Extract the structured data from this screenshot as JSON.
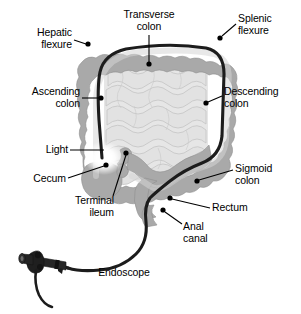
{
  "figure": {
    "type": "anatomical-diagram",
    "width": 301,
    "height": 314,
    "background": "#ffffff"
  },
  "colors": {
    "background": "#ffffff",
    "colon_wall": "#a9a9a9",
    "colon_wall_edge": "#9a9a9a",
    "colon_lumen": "#c9c9c9",
    "small_intestine": "#e4e4e4",
    "small_intestine_outline": "#bfbfbf",
    "endoscope": "#1a1a1a",
    "light_glow": "#ffffff",
    "label_text": "#000000",
    "leader_line": "#000000",
    "marker_dot": "#000000"
  },
  "labels": [
    {
      "id": "hepatic-flexure",
      "text_lines": [
        "Hepatic",
        "flexure"
      ],
      "align": "right",
      "x": 10,
      "y": 27,
      "width": 62,
      "leader": {
        "x1": 74,
        "y1": 40,
        "x2": 86,
        "y2": 44
      },
      "dot": {
        "cx": 88,
        "cy": 44,
        "r": 2.6
      }
    },
    {
      "id": "transverse-colon",
      "text_lines": [
        "Transverse",
        "colon"
      ],
      "align": "center",
      "x": 112,
      "y": 9,
      "width": 74,
      "leader": {
        "x1": 149,
        "y1": 35,
        "x2": 149,
        "y2": 62
      },
      "dot": {
        "cx": 149,
        "cy": 64,
        "r": 2.6
      }
    },
    {
      "id": "splenic-flexure",
      "text_lines": [
        "Splenic",
        "flexure"
      ],
      "align": "left",
      "x": 238,
      "y": 13,
      "width": 58,
      "leader": {
        "x1": 236,
        "y1": 24,
        "x2": 222,
        "y2": 36
      },
      "dot": {
        "cx": 220,
        "cy": 38,
        "r": 2.6
      }
    },
    {
      "id": "ascending-colon",
      "text_lines": [
        "Ascending",
        "colon"
      ],
      "align": "right",
      "x": 8,
      "y": 86,
      "width": 72,
      "leader": {
        "x1": 82,
        "y1": 98,
        "x2": 99,
        "y2": 98
      },
      "dot": {
        "cx": 101,
        "cy": 98,
        "r": 2.6
      }
    },
    {
      "id": "descending-colon",
      "text_lines": [
        "Descending",
        "colon"
      ],
      "align": "left",
      "x": 224,
      "y": 86,
      "width": 76,
      "leader": {
        "x1": 222,
        "y1": 96,
        "x2": 208,
        "y2": 102
      },
      "dot": {
        "cx": 206,
        "cy": 103,
        "r": 2.6
      }
    },
    {
      "id": "light",
      "text_lines": [
        "Light"
      ],
      "align": "right",
      "x": 28,
      "y": 144,
      "width": 40,
      "leader": {
        "x1": 70,
        "y1": 150,
        "x2": 104,
        "y2": 150
      },
      "dot": null
    },
    {
      "id": "cecum",
      "text_lines": [
        "Cecum"
      ],
      "align": "right",
      "x": 18,
      "y": 173,
      "width": 48,
      "leader": {
        "x1": 68,
        "y1": 178,
        "x2": 104,
        "y2": 166
      },
      "dot": {
        "cx": 106,
        "cy": 165,
        "r": 2.6
      }
    },
    {
      "id": "terminal-ileum",
      "text_lines": [
        "Terminal",
        "ileum"
      ],
      "align": "right",
      "x": 58,
      "y": 195,
      "width": 56,
      "leader": {
        "x1": 113,
        "y1": 196,
        "x2": 126,
        "y2": 155
      },
      "dot": {
        "cx": 126,
        "cy": 153,
        "r": 2.6
      }
    },
    {
      "id": "sigmoid-colon",
      "text_lines": [
        "Sigmoid",
        "colon"
      ],
      "align": "left",
      "x": 235,
      "y": 163,
      "width": 60,
      "leader": {
        "x1": 233,
        "y1": 170,
        "x2": 199,
        "y2": 180
      },
      "dot": {
        "cx": 197,
        "cy": 181,
        "r": 2.6
      }
    },
    {
      "id": "rectum",
      "text_lines": [
        "Rectum"
      ],
      "align": "left",
      "x": 212,
      "y": 202,
      "width": 56,
      "leader": {
        "x1": 210,
        "y1": 208,
        "x2": 172,
        "y2": 199
      },
      "dot": {
        "cx": 170,
        "cy": 198,
        "r": 2.6
      }
    },
    {
      "id": "anal-canal",
      "text_lines": [
        "Anal",
        "canal"
      ],
      "align": "left",
      "x": 183,
      "y": 221,
      "width": 44,
      "leader": {
        "x1": 182,
        "y1": 224,
        "x2": 165,
        "y2": 212
      },
      "dot": {
        "cx": 163,
        "cy": 210,
        "r": 2.6
      }
    },
    {
      "id": "endoscope",
      "text_lines": [
        "Endoscope"
      ],
      "align": "center",
      "x": 86,
      "y": 267,
      "width": 76,
      "leader": null,
      "dot": null
    }
  ],
  "structures": [
    {
      "id": "ascending-colon-segment",
      "name": "Ascending colon"
    },
    {
      "id": "hepatic-flexure-segment",
      "name": "Hepatic flexure"
    },
    {
      "id": "transverse-colon-segment",
      "name": "Transverse colon"
    },
    {
      "id": "splenic-flexure-segment",
      "name": "Splenic flexure"
    },
    {
      "id": "descending-colon-segment",
      "name": "Descending colon"
    },
    {
      "id": "sigmoid-colon-segment",
      "name": "Sigmoid colon"
    },
    {
      "id": "rectum-segment",
      "name": "Rectum"
    },
    {
      "id": "anal-canal-segment",
      "name": "Anal canal"
    },
    {
      "id": "cecum-segment",
      "name": "Cecum"
    },
    {
      "id": "terminal-ileum-segment",
      "name": "Terminal ileum"
    },
    {
      "id": "small-intestine-coils",
      "name": "Small intestine"
    },
    {
      "id": "endoscope-shaft",
      "name": "Endoscope shaft"
    },
    {
      "id": "endoscope-handle",
      "name": "Endoscope handle"
    },
    {
      "id": "endoscope-tip-light",
      "name": "Endoscope tip light"
    }
  ]
}
